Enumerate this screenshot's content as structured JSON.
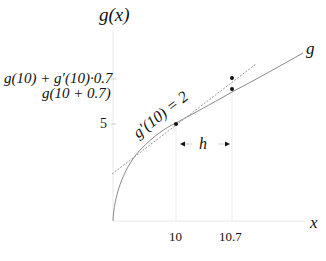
{
  "diagram": {
    "y_axis_label": "g(x)",
    "x_axis_label": "x",
    "curve_label": "g",
    "tangent_label": "g′(10) = 2",
    "step_label": "h",
    "y_ticks": [
      {
        "label": "g(10) + g′(10)·0.7",
        "value": "tangent estimate"
      },
      {
        "label": "g(10 + 0.7)",
        "value": "actual value"
      },
      {
        "label": "5",
        "value": 5
      }
    ],
    "x_ticks": [
      {
        "label": "10",
        "value": 10
      },
      {
        "label": "10.7",
        "value": 10.7
      }
    ],
    "points": [
      {
        "name": "point-at-10",
        "x": 10,
        "y": 5
      },
      {
        "name": "tangent-estimate-at-10.7",
        "x": 10.7,
        "y": 6.4
      },
      {
        "name": "curve-value-at-10.7",
        "x": 10.7,
        "y": "g(10.7)"
      }
    ],
    "colors": {
      "curve": "#8a8a8a",
      "tangent": "#8a8a8a",
      "axis": "#e6e6e6",
      "guide": "#ececec",
      "point": "#111111"
    }
  }
}
